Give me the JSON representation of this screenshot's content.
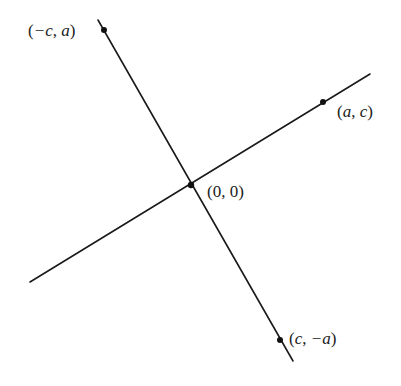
{
  "diagram": {
    "type": "perpendicular-lines",
    "colors": {
      "line": "#1a1a1a",
      "point": "#111111",
      "text": "#222222",
      "background": "#ffffff"
    },
    "lines": [
      {
        "name": "line-through-a-c",
        "x1": 30,
        "y1": 282,
        "x2": 370,
        "y2": 74
      },
      {
        "name": "perpendicular-line",
        "x1": 98,
        "y1": 20,
        "x2": 293,
        "y2": 361
      }
    ],
    "points": [
      {
        "name": "point-neg-c-a",
        "x": 104,
        "y": 30,
        "label": "(−c, a)"
      },
      {
        "name": "point-a-c",
        "x": 323,
        "y": 102,
        "label": "(a, c)"
      },
      {
        "name": "point-origin",
        "x": 191,
        "y": 185,
        "label": "(0, 0)"
      },
      {
        "name": "point-c-neg-a",
        "x": 280,
        "y": 340,
        "label": "(c, −a)"
      }
    ],
    "labels": {
      "neg_c_a": {
        "open": "(",
        "part1": "−c",
        "sep": ", ",
        "part2": "a",
        "close": ")"
      },
      "a_c": {
        "open": "(",
        "part1": "a",
        "sep": ", ",
        "part2": "c",
        "close": ")"
      },
      "origin": {
        "open": "(",
        "part1": "0",
        "sep": ", ",
        "part2": "0",
        "close": ")"
      },
      "c_neg_a": {
        "open": "(",
        "part1": "c",
        "sep": ", ",
        "part2": "−a",
        "close": ")"
      }
    }
  }
}
